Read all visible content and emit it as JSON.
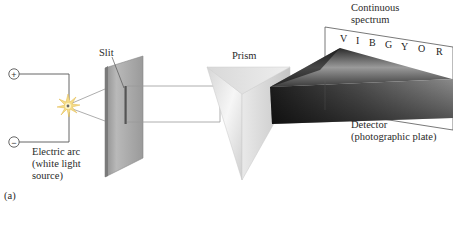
{
  "figure": {
    "panel_label": "(a)",
    "labels": {
      "continuous_spectrum_line1": "Continuous",
      "continuous_spectrum_line2": "spectrum",
      "slit": "Slit",
      "prism": "Prism",
      "electric_arc_line1": "Electric arc",
      "electric_arc_line2": "(white light",
      "electric_arc_line3": "source)",
      "detector_line1": "Detector",
      "detector_line2": "(photographic plate)"
    },
    "terminals": {
      "positive": "+",
      "negative": "−"
    },
    "spectrum_letters": [
      "V",
      "I",
      "B",
      "G",
      "Y",
      "O",
      "R"
    ]
  },
  "colors": {
    "wire": "#555555",
    "plate": "#a8a8a8",
    "prism_light": "#f2f2f2",
    "spectrum_dark": "#1a1a1a",
    "text": "#2a2a2a"
  }
}
